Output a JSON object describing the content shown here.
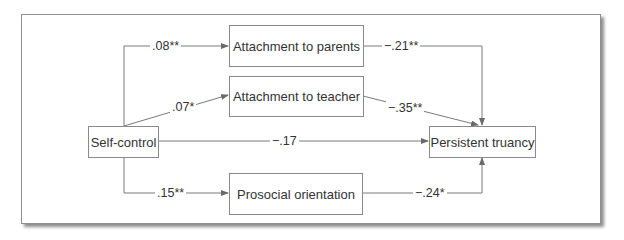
{
  "nodes": {
    "self_control": "Self-control",
    "attachment_parents": "Attachment to parents",
    "attachment_teacher": "Attachment to teacher",
    "prosocial": "Prosocial orientation",
    "truancy": "Persistent truancy"
  },
  "paths": {
    "sc_to_parents": ".08**",
    "sc_to_teacher": ".07*",
    "sc_to_prosocial": ".15**",
    "sc_to_truancy": "−.17",
    "parents_to_truancy": "−.21**",
    "teacher_to_truancy": "−.35**",
    "prosocial_to_truancy": "−.24*"
  },
  "colors": {
    "line": "#7a7a7a",
    "text": "#333333"
  }
}
